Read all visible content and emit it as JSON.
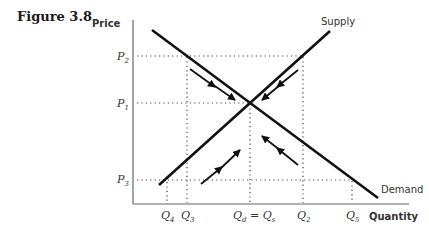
{
  "figure": {
    "title": "Figure 3.8"
  },
  "axes": {
    "y_label": "Price",
    "x_label": "Quantity"
  },
  "curves": {
    "supply_label": "Supply",
    "demand_label": "Demand"
  },
  "price_ticks": [
    {
      "base": "P",
      "sub": "2"
    },
    {
      "base": "P",
      "sub": "1"
    },
    {
      "base": "P",
      "sub": "3"
    }
  ],
  "quantity_ticks": [
    {
      "base": "Q",
      "sub": "4"
    },
    {
      "base": "Q",
      "sub": "3"
    },
    {
      "base": "Q",
      "sub": "d",
      "eq": " = ",
      "base2": "Q",
      "sub2": "s"
    },
    {
      "base": "Q",
      "sub": "2"
    },
    {
      "base": "Q",
      "sub": "5"
    }
  ],
  "colors": {
    "line": "#111111",
    "dots": "#444444",
    "text": "#333333"
  }
}
